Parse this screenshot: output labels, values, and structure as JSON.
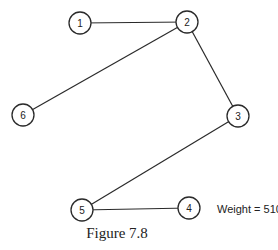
{
  "figure": {
    "caption": "Figure 7.8",
    "weight_label": "Weight = 510"
  },
  "graph": {
    "nodes": [
      {
        "id": "1",
        "label": "1",
        "x": 80,
        "y": 23
      },
      {
        "id": "2",
        "label": "2",
        "x": 187,
        "y": 22
      },
      {
        "id": "3",
        "label": "3",
        "x": 238,
        "y": 116
      },
      {
        "id": "4",
        "label": "4",
        "x": 189,
        "y": 208
      },
      {
        "id": "5",
        "label": "5",
        "x": 82,
        "y": 210
      },
      {
        "id": "6",
        "label": "6",
        "x": 23,
        "y": 115
      }
    ],
    "edges": [
      {
        "from": "1",
        "to": "2"
      },
      {
        "from": "2",
        "to": "6"
      },
      {
        "from": "2",
        "to": "3"
      },
      {
        "from": "3",
        "to": "5"
      },
      {
        "from": "5",
        "to": "4"
      }
    ],
    "node_radius": 11
  }
}
